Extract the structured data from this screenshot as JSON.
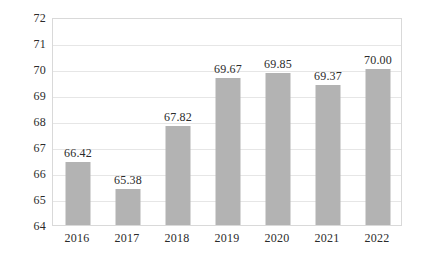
{
  "chart_data": {
    "type": "bar",
    "title": "",
    "xlabel": "",
    "ylabel": "",
    "categories": [
      "2016",
      "2017",
      "2018",
      "2019",
      "2020",
      "2021",
      "2022"
    ],
    "values": [
      66.42,
      65.38,
      67.82,
      69.67,
      69.85,
      69.37,
      70.0
    ],
    "data_labels": [
      "66.42",
      "65.38",
      "67.82",
      "69.67",
      "69.85",
      "69.37",
      "70.00"
    ],
    "ylim": [
      64,
      72
    ],
    "ytick_labels": [
      "64",
      "65",
      "66",
      "67",
      "68",
      "69",
      "70",
      "71",
      "72"
    ],
    "ytick_values": [
      64,
      65,
      66,
      67,
      68,
      69,
      70,
      71,
      72
    ],
    "grid": true,
    "legend": false,
    "legend_position": "none",
    "series": [
      {
        "name": "",
        "values": [
          66.42,
          65.38,
          67.82,
          69.67,
          69.85,
          69.37,
          70.0
        ],
        "color": "#b3b3b3"
      }
    ],
    "colors": {
      "bar": "#b3b3b3",
      "gridline": "#e6e6e6",
      "frame": "#d9d9d9",
      "text": "#2b2b2b",
      "background": "#ffffff"
    }
  }
}
